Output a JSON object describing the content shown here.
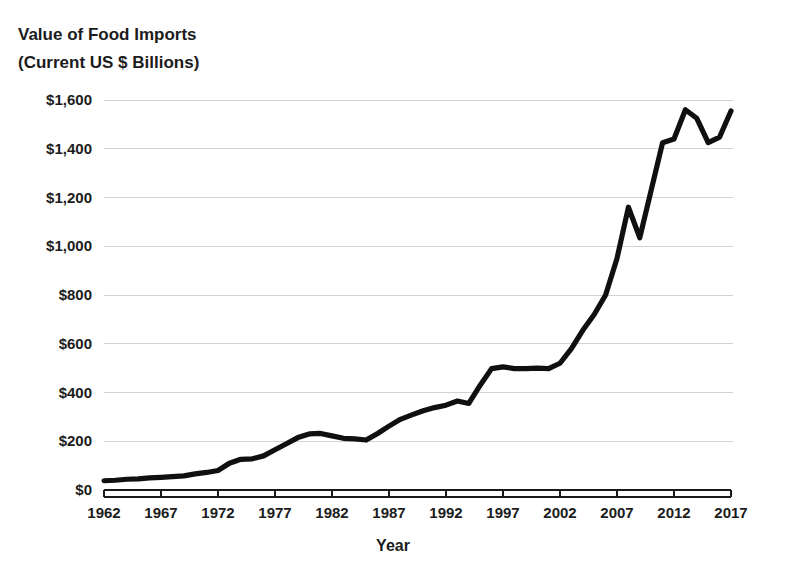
{
  "chart_data": {
    "type": "line",
    "title": "Value of Food Imports (Current US $ Billions)",
    "title_line1": "Value of Food Imports",
    "title_line2": "(Current US $ Billions)",
    "xlabel": "Year",
    "ylabel": "",
    "xlim": [
      1962,
      2017
    ],
    "ylim": [
      0,
      1700
    ],
    "grid": true,
    "legend": false,
    "legend_position": "none",
    "x_tick_labels": [
      "1962",
      "1967",
      "1972",
      "1977",
      "1982",
      "1987",
      "1992",
      "1997",
      "2002",
      "2007",
      "2012",
      "2017"
    ],
    "x_tick_values": [
      1962,
      1967,
      1972,
      1977,
      1982,
      1987,
      1992,
      1997,
      2002,
      2007,
      2012,
      2017
    ],
    "y_tick_labels": [
      "$0",
      "$200",
      "$400",
      "$600",
      "$800",
      "$1,000",
      "$1,200",
      "$1,400",
      "$1,600"
    ],
    "y_tick_values": [
      0,
      200,
      400,
      600,
      800,
      1000,
      1200,
      1400,
      1600
    ],
    "line_color": "#101010",
    "grid_color": "#d2d2d2",
    "axis_color": "#1a1a1a",
    "background_color": "#ffffff",
    "x": [
      1962,
      1963,
      1964,
      1965,
      1966,
      1967,
      1968,
      1969,
      1970,
      1971,
      1972,
      1973,
      1974,
      1975,
      1976,
      1977,
      1978,
      1979,
      1980,
      1981,
      1982,
      1983,
      1984,
      1985,
      1986,
      1987,
      1988,
      1989,
      1990,
      1991,
      1992,
      1993,
      1994,
      1995,
      1996,
      1997,
      1998,
      1999,
      2000,
      2001,
      2002,
      2003,
      2004,
      2005,
      2006,
      2007,
      2008,
      2009,
      2010,
      2011,
      2012,
      2013,
      2014,
      2015,
      2016,
      2017
    ],
    "y": [
      38,
      40,
      44,
      46,
      50,
      52,
      55,
      58,
      66,
      72,
      80,
      110,
      126,
      128,
      140,
      165,
      190,
      215,
      230,
      232,
      222,
      212,
      210,
      205,
      232,
      262,
      290,
      308,
      325,
      338,
      348,
      365,
      355,
      430,
      498,
      505,
      498,
      498,
      500,
      498,
      520,
      580,
      655,
      720,
      800,
      950,
      1160,
      1035,
      1230,
      1425,
      1440,
      1560,
      1525,
      1425,
      1448,
      1555
    ],
    "series": [
      {
        "name": "Value of Food Imports",
        "values": [
          38,
          40,
          44,
          46,
          50,
          52,
          55,
          58,
          66,
          72,
          80,
          110,
          126,
          128,
          140,
          165,
          190,
          215,
          230,
          232,
          222,
          212,
          210,
          205,
          232,
          262,
          290,
          308,
          325,
          338,
          348,
          365,
          355,
          430,
          498,
          505,
          498,
          498,
          500,
          498,
          520,
          580,
          655,
          720,
          800,
          950,
          1160,
          1035,
          1230,
          1425,
          1440,
          1560,
          1525,
          1425,
          1448,
          1555
        ]
      }
    ]
  }
}
